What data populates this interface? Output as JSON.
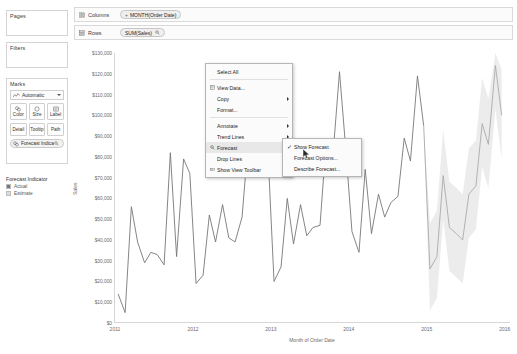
{
  "sidebar": {
    "pages": {
      "title": "Pages"
    },
    "filters": {
      "title": "Filters"
    },
    "marks": {
      "title": "Marks",
      "type_label": "Automatic",
      "type_icon": "line-chart-icon",
      "buttons": [
        {
          "label": "Color",
          "icon": "color-icon"
        },
        {
          "label": "Size",
          "icon": "size-icon"
        },
        {
          "label": "Label",
          "icon": "label-icon"
        },
        {
          "label": "Detail",
          "icon": "detail-icon"
        },
        {
          "label": "Tooltip",
          "icon": "tooltip-icon"
        },
        {
          "label": "Path",
          "icon": "path-icon"
        }
      ],
      "color_pill": {
        "label": "Forecast Indica..",
        "icon": "color-icon",
        "post_icon": "forecast-icon"
      }
    },
    "legend": {
      "title": "Forecast Indicator",
      "items": [
        {
          "label": "Actual",
          "color": "#777777"
        },
        {
          "label": "Estimate",
          "color": "#dcdcdc"
        }
      ]
    }
  },
  "shelves": {
    "columns": {
      "label": "Columns",
      "icon": "columns-icon",
      "pill": {
        "prefix": "+",
        "text": "MONTH(Order Date)"
      }
    },
    "rows": {
      "label": "Rows",
      "icon": "rows-icon",
      "pill": {
        "prefix": "",
        "text": "SUM(Sales)",
        "post_icon": "forecast-icon"
      }
    }
  },
  "context_menu": {
    "items": [
      {
        "label": "Select All",
        "icon": "",
        "has_submenu": false,
        "separator_after": true
      },
      {
        "label": "View Data...",
        "icon": "view-data-icon",
        "has_submenu": false
      },
      {
        "label": "Copy",
        "icon": "",
        "has_submenu": true
      },
      {
        "label": "Format...",
        "icon": "",
        "has_submenu": false,
        "separator_after": true
      },
      {
        "label": "Annotate",
        "icon": "",
        "has_submenu": true
      },
      {
        "label": "Trend Lines",
        "icon": "",
        "has_submenu": true
      },
      {
        "label": "Forecast",
        "icon": "forecast-icon",
        "has_submenu": true,
        "highlighted": true
      },
      {
        "label": "Drop Lines",
        "icon": "",
        "has_submenu": true
      },
      {
        "label": "Show View Toolbar",
        "icon": "toolbar-icon",
        "has_submenu": false
      }
    ],
    "submenu": {
      "items": [
        {
          "label": "Show Forecast",
          "checked": true
        },
        {
          "label": "Forecast Options...",
          "checked": false
        },
        {
          "label": "Describe Forecast...",
          "checked": false
        }
      ]
    }
  },
  "chart_data": {
    "type": "line",
    "title": "",
    "xlabel": "Month of Order Date",
    "ylabel": "Sales",
    "ylim": [
      0,
      130000
    ],
    "ytick_labels": [
      "$130,000",
      "$120,000",
      "$110,000",
      "$100,000",
      "$90,000",
      "$80,000",
      "$70,000",
      "$60,000",
      "$50,000",
      "$40,000",
      "$30,000",
      "$20,000",
      "$10,000",
      "$0"
    ],
    "ytick_values": [
      130000,
      120000,
      110000,
      100000,
      90000,
      80000,
      70000,
      60000,
      50000,
      40000,
      30000,
      20000,
      10000,
      0
    ],
    "xtick_labels": [
      "2011",
      "2012",
      "2013",
      "2014",
      "2015",
      "2016"
    ],
    "xtick_values": [
      2011,
      2012,
      2013,
      2014,
      2015,
      2016
    ],
    "grid": false,
    "legend_position": "left-sidebar",
    "series": [
      {
        "name": "Actual",
        "color": "#777777",
        "x": [
          2011.04,
          2011.13,
          2011.21,
          2011.29,
          2011.38,
          2011.46,
          2011.54,
          2011.63,
          2011.71,
          2011.79,
          2011.88,
          2011.96,
          2012.04,
          2012.13,
          2012.21,
          2012.29,
          2012.38,
          2012.46,
          2012.54,
          2012.63,
          2012.71,
          2012.79,
          2012.88,
          2012.96,
          2013.04,
          2013.13,
          2013.21,
          2013.29,
          2013.38,
          2013.46,
          2013.54,
          2013.63,
          2013.71,
          2013.79,
          2013.88,
          2013.96,
          2014.04,
          2014.13,
          2014.21,
          2014.29,
          2014.38,
          2014.46,
          2014.54,
          2014.63,
          2014.71,
          2014.79,
          2014.88,
          2014.96
        ],
        "values": [
          14000,
          5000,
          56000,
          39000,
          29000,
          34000,
          33000,
          28000,
          82000,
          32000,
          79000,
          72000,
          19000,
          23000,
          52000,
          39000,
          57000,
          41000,
          39000,
          51000,
          88000,
          79000,
          119000,
          84000,
          20000,
          27000,
          60000,
          38000,
          57000,
          42000,
          46000,
          47000,
          88000,
          78000,
          121000,
          84000,
          44000,
          34000,
          74000,
          43000,
          62000,
          51000,
          58000,
          61000,
          89000,
          78000,
          119000,
          95000
        ]
      },
      {
        "name": "Estimate",
        "color": "#aaaaaa",
        "x": [
          2014.96,
          2015.04,
          2015.13,
          2015.21,
          2015.29,
          2015.38,
          2015.46,
          2015.54,
          2015.63,
          2015.71,
          2015.79,
          2015.88,
          2015.96
        ],
        "values": [
          95000,
          26000,
          32000,
          71000,
          46000,
          43000,
          40000,
          62000,
          66000,
          96000,
          86000,
          124000,
          100000
        ],
        "band_upper": [
          95000,
          48000,
          54000,
          93000,
          68000,
          65000,
          62000,
          84000,
          88000,
          118000,
          108000,
          130000,
          122000
        ],
        "band_lower": [
          95000,
          6000,
          12000,
          50000,
          25000,
          22000,
          19000,
          41000,
          45000,
          75000,
          65000,
          103000,
          79000
        ]
      }
    ]
  }
}
